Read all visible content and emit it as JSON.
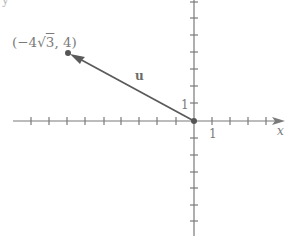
{
  "diagram": {
    "type": "vector-on-coordinate-plane",
    "corner_fragment": "y",
    "axes": {
      "x_label": "x",
      "x_unit_label": "1",
      "y_unit_label": "1",
      "x_ticks_negative": 10,
      "x_ticks_positive": 4,
      "y_ticks_positive": 7,
      "y_ticks_negative": 6
    },
    "vector": {
      "name": "u",
      "tail": [
        0,
        0
      ],
      "head_label": "(−4√3, 4)",
      "head_label_parts": {
        "open": "(−4",
        "sqrt": "√",
        "radicand": "3",
        "rest": ", 4)"
      }
    },
    "colors": {
      "axis": "#7a7a7a",
      "vector": "#5a5a5a",
      "point": "#555555",
      "text": "#7a7a7a"
    }
  }
}
